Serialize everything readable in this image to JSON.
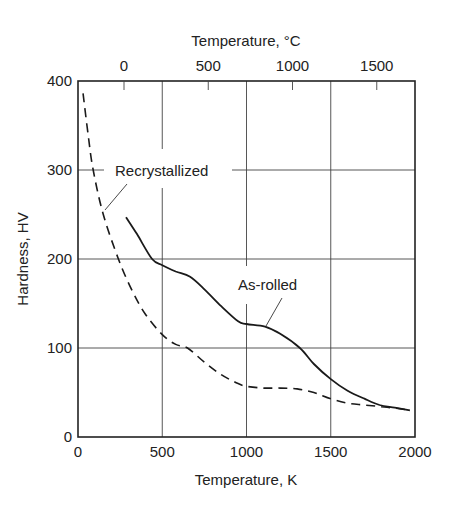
{
  "chart_data": {
    "type": "line",
    "title": "",
    "xlabel": "Temperature, K",
    "x2label": "Temperature, °C",
    "ylabel": "Hardness, HV",
    "xlim": [
      0,
      2000
    ],
    "ylim": [
      0,
      400
    ],
    "xticks": [
      0,
      500,
      1000,
      1500,
      2000
    ],
    "yticks": [
      0,
      100,
      200,
      300,
      400
    ],
    "x2ticks_celsius": [
      0,
      500,
      1000,
      1500
    ],
    "grid": true,
    "legend": "inline labels",
    "series": [
      {
        "name": "As-rolled",
        "style": "solid",
        "x": [
          285,
          350,
          440,
          500,
          580,
          665,
          750,
          850,
          950,
          1000,
          1110,
          1200,
          1317,
          1400,
          1500,
          1600,
          1700,
          1790,
          1880,
          1970
        ],
        "y": [
          247,
          228,
          200,
          193,
          186,
          180,
          166,
          147,
          130,
          127,
          124,
          116,
          100,
          82,
          65,
          52,
          43,
          36,
          33,
          30
        ]
      },
      {
        "name": "Recrystallized",
        "style": "dashed",
        "x": [
          30,
          60,
          90,
          150,
          240,
          320,
          400,
          500,
          580,
          650,
          750,
          850,
          950,
          1000,
          1100,
          1200,
          1300,
          1400,
          1500,
          1600,
          1700,
          1800,
          1900,
          1970
        ],
        "y": [
          386,
          340,
          300,
          250,
          200,
          165,
          138,
          115,
          104,
          100,
          84,
          70,
          60,
          57,
          55,
          55,
          54,
          50,
          43,
          38,
          36,
          34,
          32,
          30
        ]
      }
    ],
    "annotations": [
      {
        "text": "Recrystallized",
        "series": "Recrystallized"
      },
      {
        "text": "As-rolled",
        "series": "As-rolled"
      }
    ]
  },
  "labels": {
    "x_title": "Temperature, K",
    "x2_title": "Temperature, °C",
    "y_title": "Hardness, HV",
    "recrystallized": "Recrystallized",
    "as_rolled": "As-rolled"
  }
}
